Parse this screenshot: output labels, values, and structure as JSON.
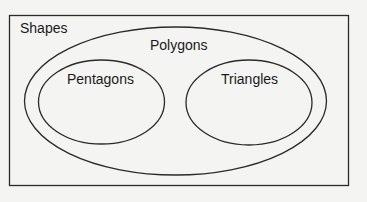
{
  "diagram": {
    "type": "venn-euler",
    "sets": {
      "universe": {
        "label": "Shapes"
      },
      "outer": {
        "label": "Polygons"
      },
      "left": {
        "label": "Pentagons"
      },
      "right": {
        "label": "Triangles"
      }
    },
    "colors": {
      "stroke": "#2a2a2a",
      "background": "#f4f4f2",
      "text": "#1a1a1a"
    }
  }
}
